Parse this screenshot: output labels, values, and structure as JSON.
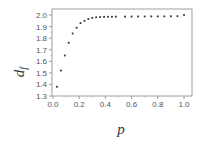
{
  "chart_data": {
    "type": "scatter",
    "title": "",
    "xlabel": "p",
    "ylabel": "d",
    "ylabel_subscript": "f",
    "xlim": [
      0.0,
      1.05
    ],
    "ylim": [
      1.3,
      2.05
    ],
    "xticks": [
      0.0,
      0.2,
      0.4,
      0.6,
      0.8,
      1.0
    ],
    "xtick_labels": [
      "0.0",
      "0.2",
      "0.4",
      "0.6",
      "0.8",
      "1.0"
    ],
    "yticks": [
      1.3,
      1.4,
      1.5,
      1.6,
      1.7,
      1.8,
      1.9,
      2.0
    ],
    "ytick_labels": [
      "1.3",
      "1.4",
      "1.5",
      "1.6",
      "1.7",
      "1.8",
      "1.9",
      "2.0"
    ],
    "grid": false,
    "legend": null,
    "marker_color": "#333333",
    "series": [
      {
        "name": "d_f",
        "x": [
          0.03,
          0.06,
          0.09,
          0.12,
          0.15,
          0.18,
          0.21,
          0.24,
          0.27,
          0.3,
          0.33,
          0.36,
          0.39,
          0.42,
          0.45,
          0.48,
          0.55,
          0.6,
          0.65,
          0.7,
          0.75,
          0.8,
          0.85,
          0.9,
          0.95,
          1.0
        ],
        "y": [
          1.38,
          1.52,
          1.65,
          1.76,
          1.84,
          1.89,
          1.93,
          1.95,
          1.965,
          1.975,
          1.98,
          1.982,
          1.984,
          1.985,
          1.985,
          1.986,
          1.986,
          1.987,
          1.987,
          1.987,
          1.988,
          1.988,
          1.988,
          1.989,
          1.99,
          2.0
        ]
      }
    ]
  }
}
